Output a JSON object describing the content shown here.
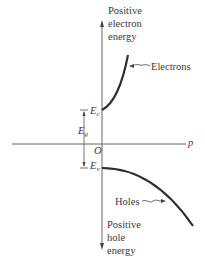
{
  "diagram": {
    "axes": {
      "vertical_top_label": [
        "Positive",
        "electron",
        "energy"
      ],
      "vertical_bottom_label": [
        "Positive",
        "hole",
        "energy"
      ],
      "horizontal_label": "p",
      "origin_label": "O"
    },
    "levels": {
      "conduction": {
        "symbol": "E",
        "subscript": "c"
      },
      "valence": {
        "symbol": "E",
        "subscript": "v"
      },
      "gap": {
        "symbol": "E",
        "subscript": "g"
      }
    },
    "curves": {
      "electrons_label": "Electrons",
      "holes_label": "Holes"
    },
    "colors": {
      "axis": "#555555",
      "curve": "#2e2e2e",
      "text": "#3a3a3a"
    }
  }
}
